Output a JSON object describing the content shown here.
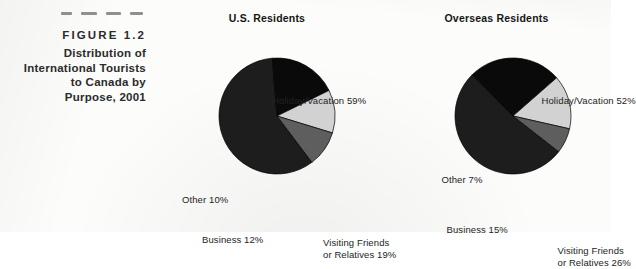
{
  "figure": {
    "label": "FIGURE 1.2",
    "caption_lines": [
      "Distribution of",
      "International Tourists",
      "to Canada by",
      "Purpose, 2001"
    ],
    "rule_marks": 4
  },
  "colors": {
    "holiday": "#1d1d1d",
    "vfr": "#0a0a0a",
    "business": "#d2d2d2",
    "other": "#5e5e5e",
    "text": "#232323",
    "page_background": "#fcfcfb",
    "slice_outline": "#000000"
  },
  "chart_data": [
    {
      "type": "pie",
      "title": "U.S. Residents",
      "categories": [
        "Holiday/Vacation",
        "Visiting Friends or Relatives",
        "Business",
        "Other"
      ],
      "values": [
        59,
        19,
        12,
        10
      ],
      "unit": "%",
      "labels": [
        "Holiday/Vacation 59%",
        "Visiting Friends",
        "or Relatives 19%",
        "Business 12%",
        "Other 10%"
      ],
      "legend": "none",
      "grid": false
    },
    {
      "type": "pie",
      "title": "Overseas Residents",
      "categories": [
        "Holiday/Vacation",
        "Visiting Friends or Relatives",
        "Business",
        "Other"
      ],
      "values": [
        52,
        26,
        15,
        7
      ],
      "unit": "%",
      "labels": [
        "Holiday/Vacation 52%",
        "Visiting Friends",
        "or Relatives 26%",
        "Business 15%",
        "Other 7%"
      ],
      "legend": "none",
      "grid": false
    }
  ],
  "us": {
    "title": "U.S. Residents",
    "holiday_label": "Holiday/Vacation 59%",
    "other_label": "Other 10%",
    "business_label": "Business 12%",
    "vfr_label_line1": "Visiting Friends",
    "vfr_label_line2": "or Relatives 19%"
  },
  "overseas": {
    "title": "Overseas Residents",
    "holiday_label": "Holiday/Vacation 52%",
    "other_label": "Other 7%",
    "business_label": "Business 15%",
    "vfr_label_line1": "Visiting Friends",
    "vfr_label_line2": "or Relatives 26%"
  }
}
